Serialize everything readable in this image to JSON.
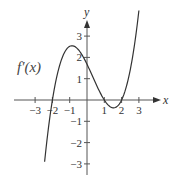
{
  "chart_data": {
    "type": "line",
    "title": "",
    "xlabel": "x",
    "ylabel": "y",
    "xlim": [
      -4.2,
      4.3
    ],
    "ylim": [
      -3.5,
      4.0
    ],
    "grid": false,
    "x_ticks": [
      -3,
      -2,
      -1,
      1,
      2,
      3
    ],
    "x_tick_labels": [
      "−3",
      "−2",
      "−1",
      "1",
      "2",
      "3"
    ],
    "y_ticks": [
      3,
      2,
      1,
      -1,
      -2,
      -3
    ],
    "y_tick_labels": [
      "3",
      "2",
      "1",
      "−1",
      "−2",
      "−3"
    ],
    "annotations": [
      {
        "text": "f′(x)",
        "x": -3.2,
        "y": 1.5
      }
    ],
    "series": [
      {
        "name": "f′(x)",
        "formula": "0.42*(x+2)*(x-1)*(x-2)",
        "x": [
          -2.45,
          -2.2,
          -2.0,
          -1.75,
          -1.5,
          -1.25,
          -1.0,
          -0.75,
          -0.5,
          -0.25,
          0,
          0.25,
          0.5,
          0.75,
          1.0,
          1.25,
          1.5,
          1.75,
          2.0,
          2.25,
          2.5,
          2.75,
          3.0
        ],
        "values": [
          -3.2,
          -1.3,
          0.0,
          0.94,
          1.58,
          2.01,
          2.27,
          2.4,
          2.4,
          2.31,
          1.68,
          1.31,
          0.94,
          0.57,
          0.0,
          -0.3,
          -0.37,
          -0.28,
          0.0,
          0.56,
          1.41,
          2.58,
          4.2
        ]
      }
    ],
    "zeros": [
      -2,
      1,
      2
    ],
    "local_max": {
      "x": -0.9,
      "y": 2.4
    },
    "local_min": {
      "x": 1.5,
      "y": -0.37
    }
  },
  "labels": {
    "x_axis": "x",
    "y_axis": "y",
    "curve": "f′(x)"
  }
}
